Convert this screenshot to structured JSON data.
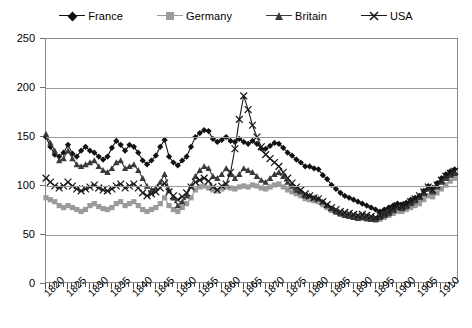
{
  "chart_data": {
    "type": "line",
    "title": "",
    "subtitle": "",
    "xlabel": "",
    "ylabel": "",
    "xlim": [
      1820,
      1914
    ],
    "ylim": [
      0,
      250
    ],
    "yticks": [
      0,
      50,
      100,
      150,
      200,
      250
    ],
    "xtick_labels": [
      "1820",
      "1825",
      "1830",
      "1835",
      "1840",
      "1845",
      "1850",
      "1855",
      "1860",
      "1865",
      "1870",
      "1875",
      "1880",
      "1885",
      "1890",
      "1895",
      "1900",
      "1905",
      "1910"
    ],
    "xtick_values": [
      1820,
      1825,
      1830,
      1835,
      1840,
      1845,
      1850,
      1855,
      1860,
      1865,
      1870,
      1875,
      1880,
      1885,
      1890,
      1895,
      1900,
      1905,
      1910
    ],
    "grid": true,
    "grid_axis": "y",
    "legend_position": "top-center",
    "x": [
      1820,
      1821,
      1822,
      1823,
      1824,
      1825,
      1826,
      1827,
      1828,
      1829,
      1830,
      1831,
      1832,
      1833,
      1834,
      1835,
      1836,
      1837,
      1838,
      1839,
      1840,
      1841,
      1842,
      1843,
      1844,
      1845,
      1846,
      1847,
      1848,
      1849,
      1850,
      1851,
      1852,
      1853,
      1854,
      1855,
      1856,
      1857,
      1858,
      1859,
      1860,
      1861,
      1862,
      1863,
      1864,
      1865,
      1866,
      1867,
      1868,
      1869,
      1870,
      1871,
      1872,
      1873,
      1874,
      1875,
      1876,
      1877,
      1878,
      1879,
      1880,
      1881,
      1882,
      1883,
      1884,
      1885,
      1886,
      1887,
      1888,
      1889,
      1890,
      1891,
      1892,
      1893,
      1894,
      1895,
      1896,
      1897,
      1898,
      1899,
      1900,
      1901,
      1902,
      1903,
      1904,
      1905,
      1906,
      1907,
      1908,
      1909,
      1910,
      1911,
      1912,
      1913
    ],
    "series": [
      {
        "name": "France",
        "color": "#111111",
        "marker": "diamond",
        "values": [
          150,
          140,
          132,
          130,
          134,
          142,
          133,
          130,
          136,
          140,
          136,
          134,
          130,
          127,
          130,
          139,
          146,
          142,
          136,
          142,
          140,
          134,
          126,
          122,
          126,
          131,
          140,
          147,
          130,
          124,
          121,
          126,
          130,
          140,
          150,
          154,
          157,
          156,
          148,
          145,
          147,
          150,
          146,
          145,
          148,
          145,
          143,
          146,
          143,
          138,
          138,
          141,
          144,
          143,
          139,
          134,
          131,
          127,
          124,
          120,
          120,
          118,
          117,
          111,
          107,
          101,
          97,
          93,
          90,
          88,
          86,
          84,
          82,
          80,
          78,
          76,
          74,
          76,
          78,
          80,
          82,
          81,
          83,
          86,
          88,
          90,
          95,
          100,
          98,
          103,
          108,
          112,
          115,
          117
        ]
      },
      {
        "name": "Germany",
        "color": "#9b9b9b",
        "marker": "square",
        "values": [
          88,
          86,
          84,
          80,
          78,
          80,
          78,
          76,
          74,
          76,
          80,
          82,
          79,
          77,
          76,
          78,
          82,
          84,
          80,
          82,
          84,
          80,
          76,
          74,
          76,
          78,
          82,
          88,
          80,
          76,
          74,
          78,
          82,
          88,
          96,
          99,
          100,
          98,
          96,
          95,
          97,
          99,
          98,
          97,
          99,
          100,
          99,
          101,
          100,
          98,
          97,
          99,
          101,
          102,
          99,
          96,
          94,
          92,
          90,
          87,
          86,
          85,
          84,
          81,
          78,
          75,
          73,
          71,
          70,
          69,
          68,
          67,
          67,
          66,
          66,
          65,
          66,
          68,
          70,
          72,
          74,
          74,
          76,
          78,
          80,
          82,
          86,
          90,
          89,
          93,
          97,
          101,
          105,
          108
        ]
      },
      {
        "name": "Britain",
        "color": "#3a3a3a",
        "marker": "triangle",
        "values": [
          153,
          144,
          136,
          126,
          128,
          136,
          128,
          122,
          120,
          122,
          124,
          126,
          120,
          116,
          114,
          118,
          124,
          126,
          118,
          120,
          122,
          116,
          108,
          100,
          96,
          98,
          104,
          112,
          96,
          88,
          80,
          84,
          90,
          100,
          110,
          116,
          120,
          118,
          110,
          108,
          112,
          118,
          112,
          108,
          112,
          118,
          116,
          114,
          110,
          106,
          104,
          108,
          112,
          114,
          110,
          104,
          100,
          96,
          94,
          90,
          90,
          88,
          87,
          84,
          80,
          77,
          74,
          72,
          70,
          69,
          68,
          67,
          68,
          67,
          66,
          66,
          68,
          70,
          72,
          75,
          78,
          77,
          79,
          82,
          85,
          88,
          92,
          97,
          94,
          99,
          104,
          108,
          111,
          113
        ]
      },
      {
        "name": "USA",
        "color": "#1a1a1a",
        "marker": "x",
        "values": [
          108,
          104,
          100,
          98,
          100,
          104,
          100,
          97,
          95,
          97,
          99,
          101,
          98,
          96,
          95,
          97,
          100,
          102,
          98,
          100,
          102,
          98,
          93,
          90,
          92,
          94,
          98,
          103,
          94,
          90,
          86,
          89,
          93,
          99,
          104,
          106,
          108,
          105,
          99,
          96,
          100,
          102,
          114,
          138,
          168,
          192,
          178,
          162,
          150,
          140,
          132,
          128,
          124,
          120,
          114,
          108,
          103,
          99,
          96,
          92,
          90,
          88,
          87,
          84,
          81,
          78,
          76,
          74,
          73,
          72,
          71,
          70,
          71,
          70,
          69,
          68,
          70,
          72,
          74,
          77,
          80,
          79,
          81,
          84,
          87,
          90,
          94,
          99,
          96,
          101,
          106,
          110,
          113,
          115
        ]
      }
    ]
  },
  "legend": {
    "items": [
      {
        "label": "France",
        "key": "france-legend-key"
      },
      {
        "label": "Germany",
        "key": "germany-legend-key"
      },
      {
        "label": "Britain",
        "key": "britain-legend-key"
      },
      {
        "label": "USA",
        "key": "usa-legend-key"
      }
    ]
  },
  "axes": {
    "y_labels": [
      "250",
      "200",
      "150",
      "100",
      "50",
      "0"
    ],
    "x_labels": [
      "1820",
      "1825",
      "1830",
      "1835",
      "1840",
      "1845",
      "1850",
      "1855",
      "1860",
      "1865",
      "1870",
      "1875",
      "1880",
      "1885",
      "1890",
      "1895",
      "1900",
      "1905",
      "1910"
    ]
  },
  "colors": {
    "france": "#111111",
    "germany": "#9b9b9b",
    "britain": "#3a3a3a",
    "usa": "#1a1a1a",
    "grid": "#9a9a9a",
    "border": "#8a8a8a",
    "background": "#ffffff"
  }
}
